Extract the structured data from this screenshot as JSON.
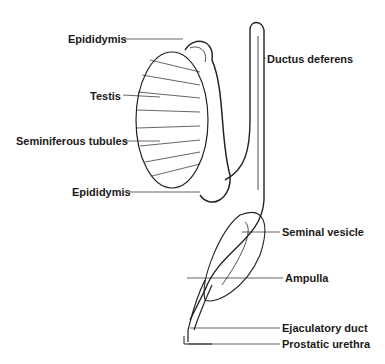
{
  "diagram": {
    "type": "anatomical illustration",
    "labels": [
      {
        "id": "epididymis_top",
        "text": "Epididymis",
        "x": 68,
        "y": 33
      },
      {
        "id": "ductus_deferens",
        "text": "Ductus deferens",
        "x": 267,
        "y": 53
      },
      {
        "id": "testis",
        "text": "Testis",
        "x": 90,
        "y": 90
      },
      {
        "id": "seminiferous_tubules",
        "text": "Seminiferous tubules",
        "x": 16,
        "y": 135
      },
      {
        "id": "epididymis_bottom",
        "text": "Epididymis",
        "x": 72,
        "y": 186
      },
      {
        "id": "seminal_vesicle",
        "text": "Seminal vesicle",
        "x": 282,
        "y": 226
      },
      {
        "id": "ampulla",
        "text": "Ampulla",
        "x": 285,
        "y": 273
      },
      {
        "id": "ejaculatory_duct",
        "text": "Ejaculatory duct",
        "x": 282,
        "y": 322
      },
      {
        "id": "prostatic_urethra",
        "text": "Prostatic urethra",
        "x": 282,
        "y": 340
      }
    ],
    "line_color": "#222222"
  }
}
